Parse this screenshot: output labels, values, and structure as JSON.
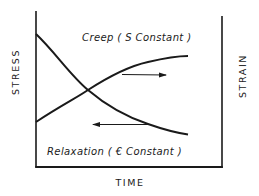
{
  "diagram": {
    "type": "creep-relaxation-schematic",
    "left_axis_label": "STRESS",
    "right_axis_label": "STRAIN",
    "x_axis_label": "TIME",
    "curves": [
      {
        "name": "Creep",
        "label": "Creep ( S Constant )",
        "trend": "increasing",
        "read_axis": "right (STRAIN)",
        "arrow_direction": "right"
      },
      {
        "name": "Relaxation",
        "label": "Relaxation ( € Constant )",
        "trend": "decreasing",
        "read_axis": "left (STRESS)",
        "arrow_direction": "left"
      }
    ],
    "colors": {
      "ink": "#1a1a1a",
      "background": "#ffffff"
    }
  }
}
